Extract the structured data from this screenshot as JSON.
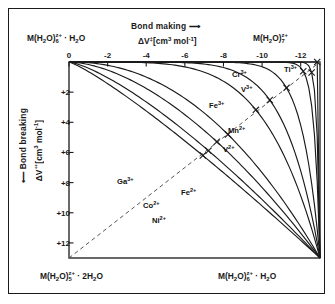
{
  "figure": {
    "type": "reaction-coordinate-diagram"
  },
  "axes": {
    "top": {
      "arrow_label": "Bond making",
      "arrow": "⟶",
      "title_symbol": "ΔV",
      "title_dagger": "‡",
      "title_units_open": "[cm",
      "title_units_exp": "3",
      "title_units_mol": "mol",
      "title_units_molexp": "-1",
      "title_units_close": "]",
      "ticks": [
        "0",
        "-2",
        "-4",
        "-6",
        "-8",
        "-10",
        "-12"
      ],
      "tick_values": [
        0,
        -2,
        -4,
        -6,
        -8,
        -10,
        -12
      ],
      "range": [
        0,
        -13
      ]
    },
    "left": {
      "arrow_label": "Bond breaking",
      "arrow": "⟵",
      "title_symbol": "ΔV",
      "title_dagger": "‡",
      "ticks": [
        "+2",
        "+4",
        "+6",
        "+8",
        "+10",
        "+12"
      ],
      "tick_values": [
        2,
        4,
        6,
        8,
        10,
        12
      ],
      "range": [
        0,
        13
      ]
    }
  },
  "corners": {
    "top_left": {
      "formula": "M(H",
      "sub1": "2",
      "mid": "O)",
      "charge_sup": "z+",
      "charge_sub": "6",
      "tail": " · H",
      "tail_sub": "2",
      "tail_end": "O"
    },
    "top_right": {
      "formula": "M(H",
      "sub1": "2",
      "mid": "O)",
      "charge_sup": "z+",
      "charge_sub": "7"
    },
    "bottom_left": {
      "formula": "M(H",
      "sub1": "2",
      "mid": "O)",
      "charge_sup": "z+",
      "charge_sub": "5",
      "tail": " · 2H",
      "tail_sub": "2",
      "tail_end": "O"
    },
    "bottom_right": {
      "formula": "M(H",
      "sub1": "2",
      "mid": "O)",
      "charge_sup": "z+",
      "charge_sub": "6",
      "tail": " · H",
      "tail_sub": "2",
      "tail_end": "O"
    }
  },
  "chart_data": {
    "type": "line",
    "title": "",
    "xlabel": "ΔV‡ [cm3 mol-1] (bond making)",
    "ylabel": "ΔV‡ [cm3 mol-1] (bond breaking)",
    "xlim": [
      0,
      -13
    ],
    "ylim": [
      0,
      13
    ],
    "grid": false,
    "legend": "inline-curve-labels",
    "diagonal_dashed_line": {
      "from": [
        0,
        13
      ],
      "to": [
        -13,
        0
      ],
      "style": "dashed",
      "note": "synchronous interchange diagonal, from bottom-left to top-right"
    },
    "marker_symbol": "x",
    "marker_note": "x marks where each curve crosses the dashed diagonal",
    "series": [
      {
        "name": "Ti3+",
        "label_sup": "3+",
        "label_base": "Ti",
        "curvature": 0.985,
        "label_x": 284,
        "label_y": 72,
        "mechanism": "associative"
      },
      {
        "name": "Cr3+",
        "label_sup": "3+",
        "label_base": "Cr",
        "curvature": 0.905,
        "label_x": 232,
        "label_y": 77,
        "mechanism": "associative interchange"
      },
      {
        "name": "V3+",
        "label_sup": "3+",
        "label_base": "V",
        "curvature": 0.86,
        "label_x": 241,
        "label_y": 92,
        "mechanism": "associative interchange"
      },
      {
        "name": "Fe3+",
        "label_sup": "3+",
        "label_base": "Fe",
        "curvature": 0.74,
        "label_x": 209,
        "label_y": 108,
        "mechanism": "associative interchange"
      },
      {
        "name": "Mn2+",
        "label_sup": "2+",
        "label_base": "Mn",
        "curvature": 0.64,
        "label_x": 228,
        "label_y": 133,
        "mechanism": "interchange"
      },
      {
        "name": "V2+",
        "label_sup": "2+",
        "label_base": "V",
        "curvature": 0.56,
        "label_x": 223,
        "label_y": 152,
        "mechanism": "interchange"
      },
      {
        "name": "Fe2+",
        "label_sup": "2+",
        "label_base": "Fe",
        "curvature": 0.375,
        "label_x": 181,
        "label_y": 195,
        "mechanism": "dissociative interchange"
      },
      {
        "name": "Ga3+",
        "label_sup": "3+",
        "label_base": "Ga",
        "curvature": 0.3,
        "label_x": 117,
        "label_y": 184,
        "mechanism": "dissociative interchange"
      },
      {
        "name": "Co2+",
        "label_sup": "2+",
        "label_base": "Co",
        "curvature": 0.215,
        "label_x": 143,
        "label_y": 208,
        "mechanism": "dissociative interchange"
      },
      {
        "name": "Ni2+",
        "label_sup": "2+",
        "label_base": "Ni",
        "curvature": 0.15,
        "label_x": 152,
        "label_y": 223,
        "mechanism": "dissociative"
      }
    ]
  }
}
